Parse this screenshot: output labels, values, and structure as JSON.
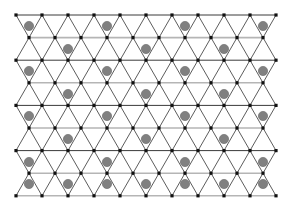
{
  "figure": {
    "name": "triangular-lattice-diagram",
    "width": 292,
    "height": 215,
    "background_color": "#ffffff"
  },
  "chart_data": {
    "type": "scatter",
    "title": "",
    "subtitle": "",
    "xlabel": "",
    "ylabel": "",
    "grid": false,
    "legend_position": "none",
    "xlim": [
      0,
      292
    ],
    "ylim": [
      0,
      215
    ],
    "layout": {
      "rows": 9,
      "row_spacing": 22.6,
      "first_row_y": 15,
      "column_spacing": 26,
      "first_column_x": 16,
      "even_row_vertex_count": 11,
      "odd_row_vertex_count": 10,
      "odd_row_x_offset": 13
    },
    "annotations": [
      "dark horizontal rows alternate with light gray horizontal rows",
      "diagonal segments connect every vertex to the two nearest vertices in the row below",
      "gray marker circles repeat every 3 lattice cells horizontally and every 1 band vertically"
    ]
  },
  "style": {
    "vertex_color": "#111111",
    "vertex_size": 3.2,
    "line_dark_color": "#3a3a3a",
    "line_light_color": "#b5b5b5",
    "diagonal_color": "#4a4a4a",
    "line_width_dark": 1.0,
    "line_width_light": 1.6,
    "diagonal_width": 0.9,
    "marker_fill": "#808080",
    "marker_stroke": "#6e6e6e",
    "marker_radius": 4.6
  },
  "rows": [
    {
      "index": 0,
      "y": 15.0,
      "parity": "even",
      "line_style": "dark",
      "x_start": 16,
      "count": 11
    },
    {
      "index": 1,
      "y": 37.6,
      "parity": "odd",
      "line_style": "light",
      "x_start": 29,
      "count": 10
    },
    {
      "index": 2,
      "y": 60.2,
      "parity": "even",
      "line_style": "dark",
      "x_start": 16,
      "count": 11
    },
    {
      "index": 3,
      "y": 82.8,
      "parity": "odd",
      "line_style": "light",
      "x_start": 29,
      "count": 10
    },
    {
      "index": 4,
      "y": 105.4,
      "parity": "even",
      "line_style": "dark",
      "x_start": 16,
      "count": 11
    },
    {
      "index": 5,
      "y": 128.0,
      "parity": "odd",
      "line_style": "light",
      "x_start": 29,
      "count": 10
    },
    {
      "index": 6,
      "y": 150.6,
      "parity": "even",
      "line_style": "dark",
      "x_start": 16,
      "count": 11
    },
    {
      "index": 7,
      "y": 173.2,
      "parity": "odd",
      "line_style": "light",
      "x_start": 29,
      "count": 10
    },
    {
      "index": 8,
      "y": 195.8,
      "parity": "even",
      "line_style": "light",
      "x_start": 16,
      "count": 11
    }
  ],
  "markers": [
    {
      "x": 29,
      "y": 26
    },
    {
      "x": 107,
      "y": 26
    },
    {
      "x": 185,
      "y": 26
    },
    {
      "x": 263,
      "y": 26
    },
    {
      "x": 68,
      "y": 49
    },
    {
      "x": 146,
      "y": 49
    },
    {
      "x": 224,
      "y": 49
    },
    {
      "x": 29,
      "y": 71
    },
    {
      "x": 107,
      "y": 71
    },
    {
      "x": 185,
      "y": 71
    },
    {
      "x": 263,
      "y": 71
    },
    {
      "x": 68,
      "y": 94
    },
    {
      "x": 146,
      "y": 94
    },
    {
      "x": 224,
      "y": 94
    },
    {
      "x": 29,
      "y": 116
    },
    {
      "x": 107,
      "y": 116
    },
    {
      "x": 185,
      "y": 116
    },
    {
      "x": 263,
      "y": 116
    },
    {
      "x": 68,
      "y": 139
    },
    {
      "x": 146,
      "y": 139
    },
    {
      "x": 224,
      "y": 139
    },
    {
      "x": 29,
      "y": 162
    },
    {
      "x": 107,
      "y": 162
    },
    {
      "x": 185,
      "y": 162
    },
    {
      "x": 263,
      "y": 162
    },
    {
      "x": 68,
      "y": 184
    },
    {
      "x": 146,
      "y": 184
    },
    {
      "x": 224,
      "y": 184
    },
    {
      "x": 29,
      "y": 184
    },
    {
      "x": 107,
      "y": 184
    },
    {
      "x": 185,
      "y": 184
    },
    {
      "x": 263,
      "y": 184
    }
  ]
}
